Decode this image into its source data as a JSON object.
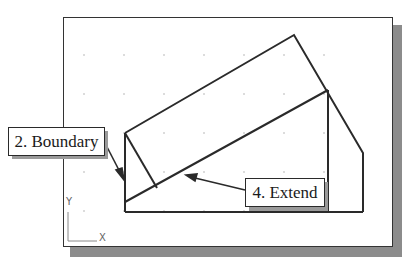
{
  "canvas": {
    "background": "#ffffff",
    "border_color": "#333333",
    "shadow_color": "#8c8c8c",
    "line_color": "#2a2a2a"
  },
  "grid": {
    "xs": [
      84,
      124,
      164,
      204,
      244,
      284,
      324
    ],
    "ys": [
      55,
      94,
      133,
      172,
      211
    ],
    "dot_color": "#b0b0b0"
  },
  "callouts": {
    "boundary": {
      "label": "2. Boundary"
    },
    "extend": {
      "label": "4. Extend"
    }
  },
  "ucs_icon": {
    "y_label": "Y",
    "x_label": "X"
  }
}
